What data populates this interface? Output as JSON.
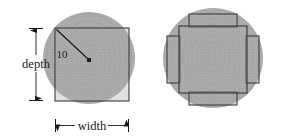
{
  "figure": {
    "background_color": "#ffffff",
    "log_fill_color": "#ababab",
    "board_fill_color": "#a8a8a8",
    "outline_color": "#3c3c3c",
    "annotation_color": "#1a1a1a",
    "panels": [
      {
        "id": "left-panel",
        "name": "single-board-in-log",
        "labels": {
          "depth": "depth",
          "width": "width",
          "radius": "10"
        },
        "log": {
          "cx": 89,
          "cy": 58,
          "r": 46
        },
        "board": {
          "x": 55,
          "y": 28,
          "w": 74,
          "h": 73
        },
        "center_marker": {
          "cx": 89,
          "cy": 60,
          "size": 3
        },
        "radius_line": {
          "x1": 56,
          "y1": 29,
          "x2": 88,
          "y2": 59
        }
      },
      {
        "id": "right-panel",
        "name": "multi-board-in-log",
        "log": {
          "cx": 213,
          "cy": 58,
          "r": 50
        },
        "center_board": {
          "x": 179,
          "y": 26,
          "w": 68,
          "h": 67
        },
        "side_boards": [
          {
            "name": "top-board",
            "x": 189,
            "y": 14,
            "w": 48,
            "h": 13
          },
          {
            "name": "bottom-board",
            "x": 189,
            "y": 92,
            "w": 48,
            "h": 13
          },
          {
            "name": "left-board",
            "x": 167,
            "y": 36,
            "w": 13,
            "h": 47
          },
          {
            "name": "right-board",
            "x": 246,
            "y": 36,
            "w": 13,
            "h": 47
          }
        ]
      }
    ]
  }
}
